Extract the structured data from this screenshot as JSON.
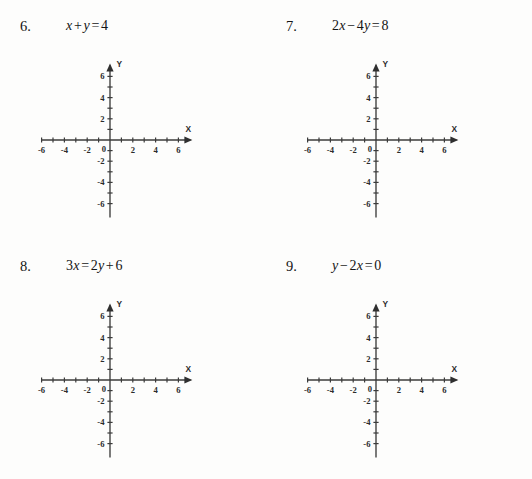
{
  "page": {
    "background_color": "#fdfdfc",
    "ink_color": "#141414",
    "axis_color": "#3b3b3b"
  },
  "problems": [
    {
      "number": "6.",
      "equation_text": "x + y = 4",
      "equation_parts": [
        {
          "kind": "var",
          "text": "x"
        },
        {
          "kind": "op",
          "text": "+"
        },
        {
          "kind": "var",
          "text": "y"
        },
        {
          "kind": "op",
          "text": "="
        },
        {
          "kind": "num",
          "text": "4"
        }
      ]
    },
    {
      "number": "7.",
      "equation_text": "2x − 4y = 8",
      "equation_parts": [
        {
          "kind": "num",
          "text": "2"
        },
        {
          "kind": "var",
          "text": "x"
        },
        {
          "kind": "op",
          "text": "−"
        },
        {
          "kind": "num",
          "text": "4"
        },
        {
          "kind": "var",
          "text": "y"
        },
        {
          "kind": "op",
          "text": "="
        },
        {
          "kind": "num",
          "text": "8"
        }
      ]
    },
    {
      "number": "8.",
      "equation_text": "3x = 2y + 6",
      "equation_parts": [
        {
          "kind": "num",
          "text": "3"
        },
        {
          "kind": "var",
          "text": "x"
        },
        {
          "kind": "op",
          "text": "="
        },
        {
          "kind": "num",
          "text": "2"
        },
        {
          "kind": "var",
          "text": "y"
        },
        {
          "kind": "op",
          "text": "+"
        },
        {
          "kind": "num",
          "text": "6"
        }
      ]
    },
    {
      "number": "9.",
      "equation_text": "y − 2x = 0",
      "equation_parts": [
        {
          "kind": "var",
          "text": "y"
        },
        {
          "kind": "op",
          "text": "−"
        },
        {
          "kind": "num",
          "text": "2"
        },
        {
          "kind": "var",
          "text": "x"
        },
        {
          "kind": "op",
          "text": "="
        },
        {
          "kind": "num",
          "text": "0"
        }
      ]
    }
  ],
  "chart_data": {
    "type": "scatter",
    "title": "",
    "xlabel": "X",
    "ylabel": "Y",
    "xlim": [
      -6,
      6
    ],
    "ylim": [
      -6,
      6
    ],
    "grid": false,
    "legend": null,
    "x_tick_positions": [
      -6,
      -5,
      -4,
      -3,
      -2,
      -1,
      0,
      1,
      2,
      3,
      4,
      5,
      6
    ],
    "y_tick_positions": [
      -6,
      -5,
      -4,
      -3,
      -2,
      -1,
      0,
      1,
      2,
      3,
      4,
      5,
      6
    ],
    "x_tick_labels": [
      {
        "value": -6,
        "text": "-6"
      },
      {
        "value": -4,
        "text": "-4"
      },
      {
        "value": -2,
        "text": "-2"
      },
      {
        "value": 2,
        "text": "2"
      },
      {
        "value": 4,
        "text": "4"
      },
      {
        "value": 6,
        "text": "6"
      }
    ],
    "y_tick_labels": [
      {
        "value": 6,
        "text": "6"
      },
      {
        "value": 4,
        "text": "4"
      },
      {
        "value": 2,
        "text": "2"
      },
      {
        "value": -2,
        "text": "-2"
      },
      {
        "value": -4,
        "text": "-4"
      },
      {
        "value": -6,
        "text": "-6"
      }
    ],
    "origin_label": "0",
    "series": [],
    "values": [],
    "note": "Four identical blank Cartesian grids; no curves or data points are plotted."
  }
}
